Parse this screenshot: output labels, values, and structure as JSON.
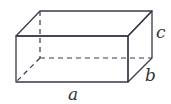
{
  "diagram": {
    "type": "rectangular-prism",
    "labels": {
      "length": "a",
      "depth": "b",
      "height": "c"
    },
    "colors": {
      "front_face": "#a9acd9",
      "top_face": "#aeb1dc",
      "side_face": "#b1b4de",
      "edge": "#3a3a4a"
    }
  }
}
